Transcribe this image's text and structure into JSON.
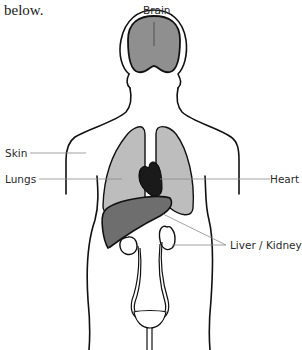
{
  "intro": {
    "line1_partial": "... body parts diagram",
    "line2": "below."
  },
  "diagram": {
    "labels": {
      "brain": "Brain",
      "skin": "Skin",
      "lungs": "Lungs",
      "heart": "Heart",
      "liver_kidneys": "Liver / Kidneys"
    },
    "colors": {
      "outline": "#111111",
      "brain_fill": "#8f8f8f",
      "lungs_fill": "#bdbdbd",
      "heart_fill": "#1a1a1a",
      "liver_fill": "#6e6e6e",
      "leader_line": "#8a8a8a"
    }
  }
}
